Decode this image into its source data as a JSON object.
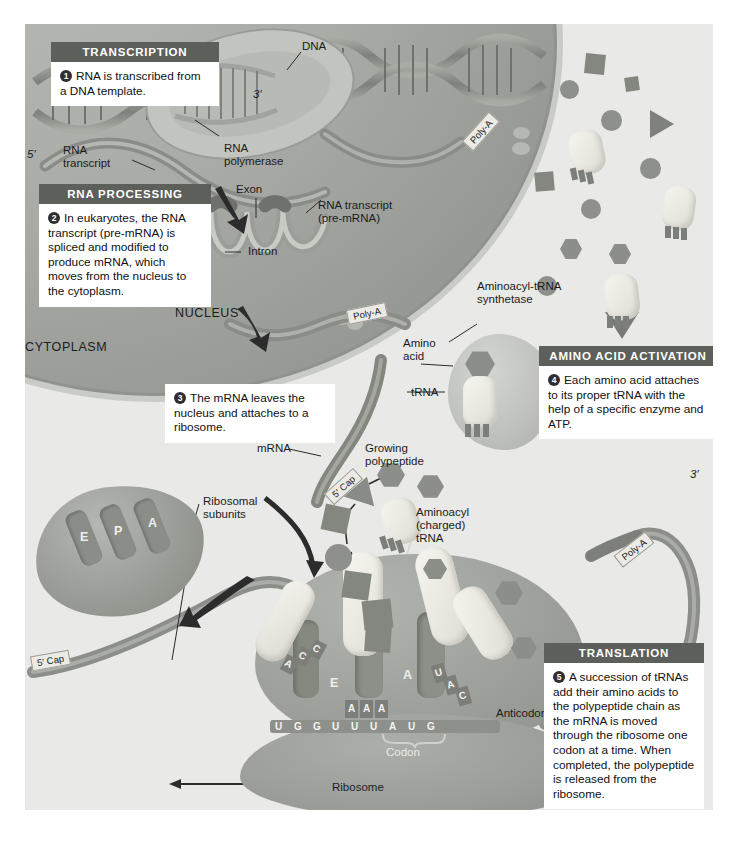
{
  "figure": {
    "background_color": "#e9e9e7",
    "header_color": "#5d5f5b"
  },
  "callouts": [
    {
      "id": "transcription",
      "header": "TRANSCRIPTION",
      "number": "1",
      "text": "RNA is transcribed from a DNA template."
    },
    {
      "id": "rna-processing",
      "header": "RNA PROCESSING",
      "number": "2",
      "text": "In eukaryotes, the RNA transcript (pre-mRNA) is spliced and modified to produce mRNA, which moves from the nucleus to the cytoplasm."
    },
    {
      "id": "mrna-leaves",
      "header": "",
      "number": "3",
      "text": "The mRNA leaves the nucleus and attaches to a ribosome."
    },
    {
      "id": "amino-acid-activation",
      "header": "AMINO ACID ACTIVATION",
      "number": "4",
      "text": "Each amino acid attaches to its proper tRNA with the help of a specific enzyme and ATP."
    },
    {
      "id": "translation",
      "header": "TRANSLATION",
      "number": "5",
      "text": "A succession of tRNAs add their amino acids to the polypeptide chain as the mRNA is moved through the ribosome one codon at a time. When completed, the polypeptide is released from the ribosome."
    }
  ],
  "labels": {
    "dna": "DNA",
    "three_prime_top": "3′",
    "five_prime_left": "5′",
    "rna_transcript": "RNA\ntranscript",
    "rna_polymerase": "RNA\npolymerase",
    "exon": "Exon",
    "intron": "Intron",
    "rna_transcript_pre_mrna": "RNA transcript\n(pre-mRNA)",
    "nucleus": "NUCLEUS",
    "cytoplasm": "CYTOPLASM",
    "aminoacyl_trna_synthetase": "Aminoacyl-tRNA\nsynthetase",
    "amino_acid": "Amino\nacid",
    "trna": "tRNA",
    "mrna": "mRNA",
    "growing_polypeptide": "Growing\npolypeptide",
    "aminoacyl_charged_trna": "Aminoacyl\n(charged)\ntRNA",
    "ribosomal_subunits": "Ribosomal\nsubunits",
    "anticodon": "Anticodon",
    "codon": "Codon",
    "ribosome": "Ribosome",
    "three_prime_right": "3′"
  },
  "tags": {
    "poly_a_nucleus_top": "Poly-A",
    "poly_a_nucleus_bottom": "Poly-A",
    "poly_a_right": "Poly-A",
    "five_cap_upper": "5′ Cap",
    "five_cap_lower": "5′ Cap"
  },
  "ribosome_sites": {
    "e_site": "E",
    "p_site": "P",
    "a_site": "A",
    "e_site_small": "E",
    "a_site_small": "A"
  },
  "sequences": {
    "mrna_codons": [
      "U",
      "G",
      "G",
      "U",
      "U",
      "U",
      "A",
      "U",
      "G"
    ],
    "anticodon_exiting": [
      "A",
      "C",
      "C"
    ],
    "anticodon_p_site": [
      "A",
      "A",
      "A"
    ],
    "anticodon_a_site": [
      "U",
      "A",
      "C"
    ]
  }
}
